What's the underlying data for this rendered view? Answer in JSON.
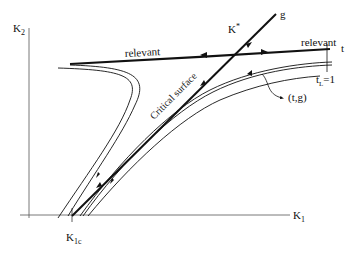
{
  "diagram": {
    "axes": {
      "x_label": "K",
      "x_sub": "1",
      "y_label": "K",
      "y_sub": "2"
    },
    "points": {
      "critical_point": "K",
      "critical_point_sup": "*",
      "k1c_main": "K",
      "k1c_sub": "1c"
    },
    "lines": {
      "g_label": "g",
      "t_label": "t",
      "relevant_left": "relevant",
      "relevant_right": "relevant",
      "critical_surface": "Critical surface",
      "tL_main": "t",
      "tL_sub": "L",
      "tL_value": "=1",
      "flow_label": "(t,g)"
    },
    "colors": {
      "ink": "#111111",
      "axis": "#555555",
      "background": "#ffffff"
    }
  }
}
